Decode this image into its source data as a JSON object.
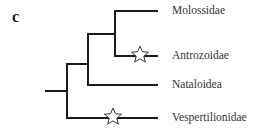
{
  "panel_label": "c",
  "tree": {
    "taxa": [
      {
        "name": "Molossidae",
        "y": 11,
        "has_star": false
      },
      {
        "name": "Antrozoidae",
        "y": 56,
        "has_star": true
      },
      {
        "name": "Nataloidea",
        "y": 85,
        "has_star": false
      },
      {
        "name": "Vespertilionidae",
        "y": 118,
        "has_star": true
      }
    ],
    "marker_icon": "star-outline",
    "line_color": "#1a1a1a"
  }
}
